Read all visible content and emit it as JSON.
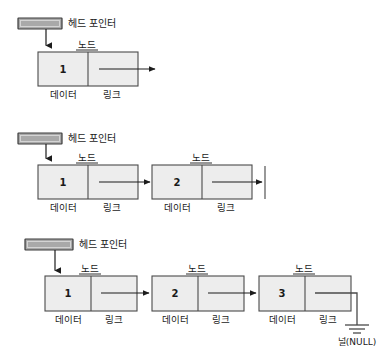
{
  "figure": {
    "colors": {
      "node_fill": "#ededed",
      "node_stroke": "#4a4a4a",
      "head_fill": "#a9a9a9",
      "arrow": "#1c1c1c",
      "background": "#ffffff"
    },
    "labels": {
      "head_pointer": "헤드 포인터",
      "node": "노드",
      "data": "데이터",
      "link": "링크",
      "null": "널(NULL)"
    },
    "diagrams": [
      {
        "id": "diagram-1",
        "node_count": 1,
        "nodes": [
          {
            "value": "1",
            "data_label": "데이터",
            "link_label": "링크",
            "node_label": "노드"
          }
        ],
        "head_pointer_label": "헤드 포인터",
        "terminator": "open-arrow"
      },
      {
        "id": "diagram-2",
        "node_count": 2,
        "nodes": [
          {
            "value": "1",
            "data_label": "데이터",
            "link_label": "링크",
            "node_label": "노드"
          },
          {
            "value": "2",
            "data_label": "데이터",
            "link_label": "링크",
            "node_label": "노드"
          }
        ],
        "head_pointer_label": "헤드 포인터",
        "terminator": "vertical-bar"
      },
      {
        "id": "diagram-3",
        "node_count": 3,
        "nodes": [
          {
            "value": "1",
            "data_label": "데이터",
            "link_label": "링크",
            "node_label": "노드"
          },
          {
            "value": "2",
            "data_label": "데이터",
            "link_label": "링크",
            "node_label": "노드"
          },
          {
            "value": "3",
            "data_label": "데이터",
            "link_label": "링크",
            "node_label": "노드"
          }
        ],
        "head_pointer_label": "헤드 포인터",
        "terminator": "ground-null",
        "terminator_label": "널(NULL)"
      }
    ]
  }
}
